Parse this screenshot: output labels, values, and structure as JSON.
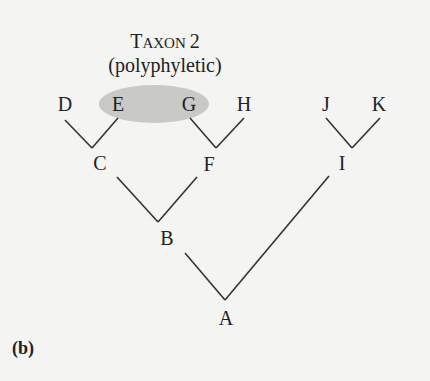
{
  "figure": {
    "panel_label": "(b)",
    "taxon_title": {
      "line1_cap": "T",
      "line1_rest": "AXON",
      "line1_num": "2",
      "line2": "(polyphyletic)"
    },
    "highlight_color": "#c9c9c7",
    "line_color": "#333333",
    "nodes": {
      "D": "D",
      "E": "E",
      "G": "G",
      "H": "H",
      "J": "J",
      "K": "K",
      "C": "C",
      "F": "F",
      "I": "I",
      "B": "B",
      "A": "A"
    },
    "edges": [
      [
        "D",
        "C"
      ],
      [
        "E",
        "C"
      ],
      [
        "G",
        "F"
      ],
      [
        "H",
        "F"
      ],
      [
        "J",
        "I"
      ],
      [
        "K",
        "I"
      ],
      [
        "C",
        "B"
      ],
      [
        "F",
        "B"
      ],
      [
        "B",
        "A"
      ],
      [
        "I",
        "A"
      ]
    ],
    "highlighted_group": [
      "E",
      "G"
    ]
  }
}
